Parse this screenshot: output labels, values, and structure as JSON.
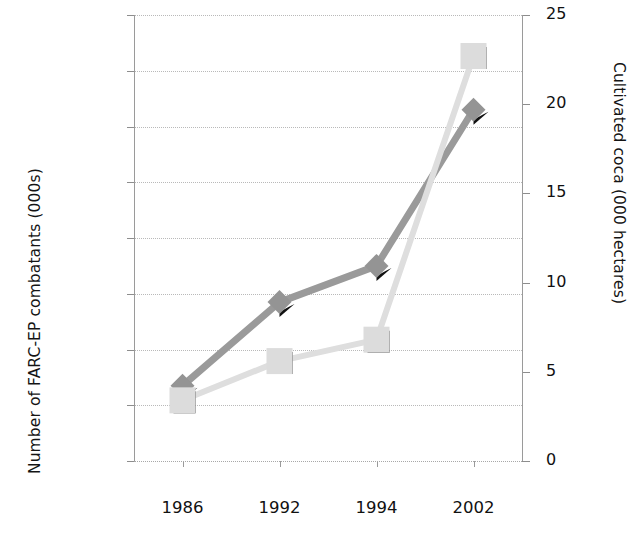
{
  "chart_data": {
    "type": "line",
    "title": "",
    "categories": [
      "1986",
      "1992",
      "1994",
      "2002"
    ],
    "series": [
      {
        "name": "Number of FARC-EP combatants (000s)",
        "axis": "left",
        "marker": "diamond",
        "color": "#949494",
        "values": [
          27,
          57,
          70,
          126
        ]
      },
      {
        "name": "Cultivated coca (000 hectares)",
        "axis": "right",
        "marker": "square",
        "color": "#dcdcdc",
        "values": [
          3.4,
          5.6,
          6.8,
          22.7
        ]
      }
    ],
    "xlabel": "",
    "ylabel": "Number of FARC-EP combatants (000s)",
    "y2label": "Cultivated coca (000 hectares)",
    "ylim": [
      0,
      160
    ],
    "y2lim": [
      0,
      25
    ],
    "yticks": [
      0,
      20,
      40,
      60,
      80,
      100,
      120,
      140,
      160
    ],
    "y2ticks": [
      0,
      5,
      10,
      15,
      20,
      25
    ],
    "grid": true,
    "legend": "none"
  },
  "axes": {
    "left": {
      "title": "Number of FARC-EP combatants (000s)",
      "ticks": [
        "160",
        "140",
        "120",
        "100",
        "80",
        "60",
        "40",
        "20",
        "0"
      ]
    },
    "right": {
      "title": "Cultivated coca (000 hectares)",
      "ticks": [
        "25",
        "20",
        "15",
        "10",
        "5",
        "0"
      ]
    },
    "x": {
      "ticks": [
        "1986",
        "1992",
        "1994",
        "2002"
      ]
    }
  }
}
